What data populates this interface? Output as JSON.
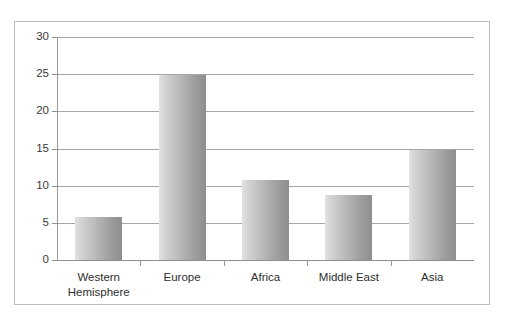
{
  "top_sliver": {
    "ghost_text": "cut off header text"
  },
  "chart_data": {
    "type": "bar",
    "title": "",
    "subtitle": "",
    "xlabel": "",
    "ylabel": "",
    "categories": [
      "Western Hemisphere",
      "Europe",
      "Africa",
      "Middle East",
      "Asia"
    ],
    "category_lines": [
      [
        "Western",
        "Hemisphere"
      ],
      [
        "Europe",
        ""
      ],
      [
        "Africa",
        ""
      ],
      [
        "Middle East",
        ""
      ],
      [
        "Asia",
        ""
      ]
    ],
    "values": [
      5.8,
      24.9,
      10.8,
      8.7,
      14.8
    ],
    "ylim": [
      0,
      30
    ],
    "ytick_labels": [
      "0",
      "5",
      "10",
      "15",
      "20",
      "25",
      "30"
    ],
    "ytick_values": [
      0,
      5,
      10,
      15,
      20,
      25,
      30
    ],
    "grid": true,
    "grid_axis": "y",
    "legend": false,
    "legend_position": "none",
    "bar_color_light": "#e2e2e2",
    "bar_color_dark": "#8e8e8e",
    "gridline_color": "#a6a6a6",
    "axis_color": "#8f8f8f",
    "border_color": "#bdbdbd",
    "background": "#ffffff"
  }
}
